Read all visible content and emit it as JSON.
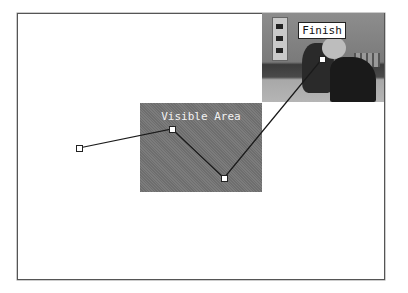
{
  "canvas": {
    "frame": {
      "x": 17,
      "y": 13,
      "width": 367,
      "height": 266
    },
    "background_image": {
      "description": "grayscale martial arts photo (finish frame)",
      "x": 262,
      "y": 13,
      "width": 122,
      "height": 89
    },
    "finish_label": "Finish",
    "visible_area": {
      "label": "Visible Area",
      "x": 140,
      "y": 103,
      "width": 122,
      "height": 89,
      "color": "#757575"
    },
    "motion_path": {
      "points": [
        {
          "name": "start",
          "x": 79,
          "y": 148
        },
        {
          "name": "point-2",
          "x": 172,
          "y": 129
        },
        {
          "name": "point-3",
          "x": 224,
          "y": 178
        },
        {
          "name": "finish",
          "x": 322,
          "y": 59
        }
      ]
    }
  }
}
